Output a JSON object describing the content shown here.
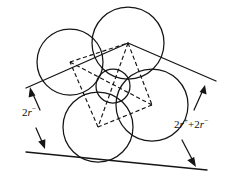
{
  "figure": {
    "background_color": "#ffffff",
    "stroke_color": "#151515",
    "labels": {
      "left": {
        "name": "left-dimension-label",
        "coefficient": "2",
        "symbol": "r",
        "superscript": "−",
        "full_text": "2r−"
      },
      "right": {
        "name": "right-dimension-label",
        "coefficient_a": "2",
        "symbol_a": "r",
        "superscript_a": "+",
        "operator": "+",
        "coefficient_b": "2",
        "symbol_b": "r",
        "superscript_b": "−",
        "full_text": "2r+ + 2r−"
      }
    },
    "circles": [
      {
        "name": "circle-top",
        "cx": 128,
        "cy": 43,
        "r": 36,
        "role": "large-anion"
      },
      {
        "name": "circle-left",
        "cx": 70,
        "cy": 62,
        "r": 33,
        "role": "large-anion"
      },
      {
        "name": "circle-right",
        "cx": 152,
        "cy": 105,
        "r": 36,
        "role": "large-anion"
      },
      {
        "name": "circle-bottom",
        "cx": 98,
        "cy": 127,
        "r": 35,
        "role": "large-anion"
      },
      {
        "name": "circle-center-small",
        "cx": 113,
        "cy": 86,
        "r": 17,
        "role": "small-cation"
      }
    ],
    "rhombus_vertices": [
      {
        "name": "vertex-left",
        "x": 70,
        "y": 62
      },
      {
        "name": "vertex-top",
        "x": 128,
        "y": 43
      },
      {
        "name": "vertex-right",
        "x": 152,
        "y": 105
      },
      {
        "name": "vertex-bottom",
        "x": 98,
        "y": 127
      }
    ],
    "diagonals": [
      {
        "name": "diagonal-top-bottom",
        "from": "vertex-top",
        "to": "vertex-bottom"
      },
      {
        "name": "diagonal-left-right",
        "from": "vertex-left",
        "to": "vertex-right"
      }
    ],
    "tangent_lines": [
      {
        "name": "tangent-line-upper",
        "x1": 26,
        "y1": 88,
        "x2": 128,
        "y2": 43,
        "x3": 216,
        "y3": 81
      },
      {
        "name": "tangent-line-lower",
        "x1": 26,
        "y1": 152,
        "x2": 207,
        "y2": 170
      }
    ],
    "dimension_arrows": [
      {
        "name": "arrow-upper-left",
        "direction": "up"
      },
      {
        "name": "arrow-lower-left",
        "direction": "down"
      },
      {
        "name": "arrow-upper-right",
        "direction": "up"
      },
      {
        "name": "arrow-lower-right",
        "direction": "down"
      }
    ]
  }
}
